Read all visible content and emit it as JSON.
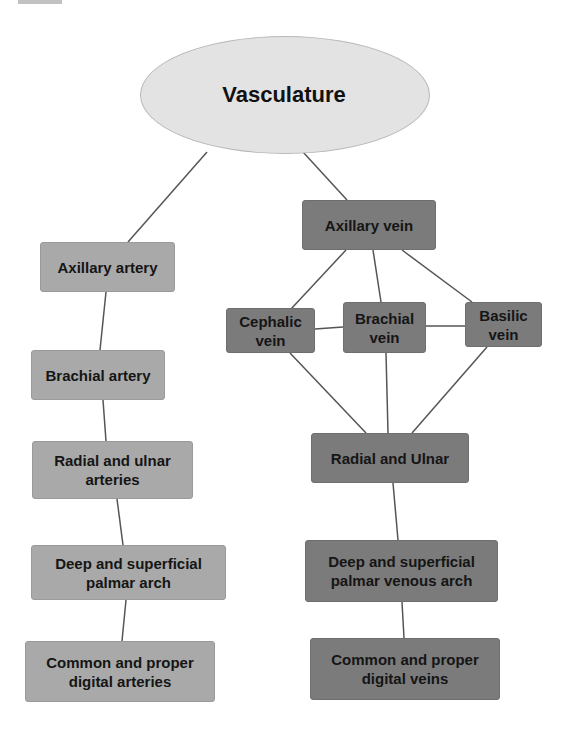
{
  "root": {
    "label": "Vasculature",
    "fill": "#e3e3e3"
  },
  "colors": {
    "artery_fill": "#a9a9a9",
    "vein_fill": "#7b7b7b",
    "line": "#555555",
    "text": "#151515"
  },
  "arteries": [
    {
      "id": "axillary-artery",
      "label": "Axillary artery"
    },
    {
      "id": "brachial-artery",
      "label": "Brachial artery"
    },
    {
      "id": "radial-ulnar-arteries",
      "label": "Radial and ulnar arteries"
    },
    {
      "id": "palmar-arch",
      "label": "Deep and superficial palmar arch"
    },
    {
      "id": "digital-arteries",
      "label": "Common and proper digital arteries"
    }
  ],
  "veins": [
    {
      "id": "axillary-vein",
      "label": "Axillary vein"
    },
    {
      "id": "cephalic-vein",
      "label": "Cephalic vein"
    },
    {
      "id": "brachial-vein",
      "label": "Brachial vein"
    },
    {
      "id": "basilic-vein",
      "label": "Basilic vein"
    },
    {
      "id": "radial-ulnar-veins",
      "label": "Radial and Ulnar"
    },
    {
      "id": "palmar-venous-arch",
      "label": "Deep and superficial palmar venous arch"
    },
    {
      "id": "digital-veins",
      "label": "Common and proper digital veins"
    }
  ],
  "edges": [
    [
      "Vasculature",
      "Axillary artery"
    ],
    [
      "Vasculature",
      "Axillary vein"
    ],
    [
      "Axillary artery",
      "Brachial artery"
    ],
    [
      "Brachial artery",
      "Radial and ulnar arteries"
    ],
    [
      "Radial and ulnar arteries",
      "Deep and superficial palmar arch"
    ],
    [
      "Deep and superficial palmar arch",
      "Common and proper digital arteries"
    ],
    [
      "Axillary vein",
      "Cephalic vein"
    ],
    [
      "Axillary vein",
      "Brachial vein"
    ],
    [
      "Axillary vein",
      "Basilic vein"
    ],
    [
      "Cephalic vein",
      "Brachial vein"
    ],
    [
      "Brachial vein",
      "Basilic vein"
    ],
    [
      "Cephalic vein",
      "Radial and Ulnar"
    ],
    [
      "Brachial vein",
      "Radial and Ulnar"
    ],
    [
      "Basilic vein",
      "Radial and Ulnar"
    ],
    [
      "Radial and Ulnar",
      "Deep and superficial palmar venous arch"
    ],
    [
      "Deep and superficial palmar venous arch",
      "Common and proper digital veins"
    ]
  ]
}
